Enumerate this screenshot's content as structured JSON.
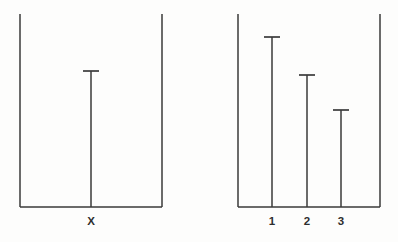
{
  "figure": {
    "background_color": "#fdfdfc",
    "line_color": "#3a3a3a",
    "label_color": "#2e2e2e",
    "width": 398,
    "height": 242
  },
  "chart_data": {
    "type": "bar",
    "title": "",
    "subtitle": "",
    "xlabel": "",
    "ylabel": "",
    "grid": false,
    "legend": null,
    "orientation": "vertical",
    "bar_style": "t-capped-stem",
    "panels": [
      {
        "name": "left-panel",
        "categories": [
          "X"
        ],
        "values": [
          0.705
        ],
        "value_unit": "fraction-of-axis-height",
        "ylim": [
          0,
          1
        ],
        "axis": {
          "left_x": 20,
          "right_x": 162,
          "top_y": 14,
          "baseline_y": 207
        },
        "bars": [
          {
            "label": "X",
            "x": 91,
            "cap_y": 71,
            "value": 0.705
          }
        ]
      },
      {
        "name": "right-panel",
        "categories": [
          "1",
          "2",
          "3"
        ],
        "values": [
          0.881,
          0.684,
          0.503
        ],
        "value_unit": "fraction-of-axis-height",
        "ylim": [
          0,
          1
        ],
        "axis": {
          "left_x": 238,
          "right_x": 380,
          "top_y": 14,
          "baseline_y": 207
        },
        "bars": [
          {
            "label": "1",
            "x": 272,
            "cap_y": 37,
            "value": 0.881
          },
          {
            "label": "2",
            "x": 307,
            "cap_y": 75,
            "value": 0.684
          },
          {
            "label": "3",
            "x": 341,
            "cap_y": 110,
            "value": 0.503
          }
        ]
      }
    ],
    "cap_half_width": 8,
    "label_baseline_y": 225
  },
  "labels": {
    "left_panel": {
      "x": "X"
    },
    "right_panel": {
      "one": "1",
      "two": "2",
      "three": "3"
    }
  }
}
